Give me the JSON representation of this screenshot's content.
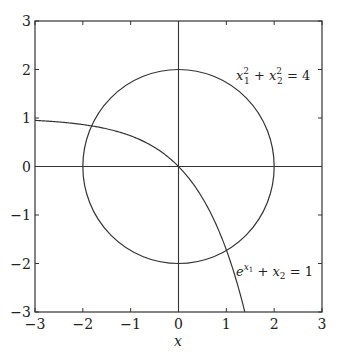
{
  "chart_data": {
    "type": "line",
    "title": "",
    "xlabel": "x",
    "ylabel": "",
    "xlim": [
      -3,
      3
    ],
    "ylim": [
      -3,
      3
    ],
    "grid": false,
    "axes_through_origin": true,
    "x_ticks": [
      "-3",
      "-2",
      "-1",
      "0",
      "1",
      "2",
      "3"
    ],
    "y_ticks": [
      "-3",
      "-2",
      "-1",
      "0",
      "1",
      "2",
      "3"
    ],
    "series": [
      {
        "name": "circle",
        "equation": "x1^2 + x2^2 = 4",
        "kind": "circle",
        "center": [
          0,
          0
        ],
        "radius": 2
      },
      {
        "name": "exponential",
        "equation": "e^{x1} + x2 = 1",
        "kind": "function",
        "function": "y = 1 - e^x",
        "x": [
          -3,
          -2,
          -1,
          0,
          0.5,
          1,
          1.386
        ],
        "y": [
          0.95,
          0.865,
          0.632,
          0,
          -0.649,
          -1.718,
          -3
        ]
      }
    ],
    "annotations": [
      {
        "text": "x₁² + x₂² = 4",
        "x": 1.2,
        "y": 1.8
      },
      {
        "text": "eˣ¹ + x₂ = 1",
        "x": 1.2,
        "y": -2.2
      }
    ],
    "intersections": [
      [
        -1.82,
        0.84
      ],
      [
        1.0,
        -1.73
      ]
    ]
  },
  "labels": {
    "xlabel": "x",
    "circle_eq_main": "x",
    "exp_eq": "e"
  }
}
